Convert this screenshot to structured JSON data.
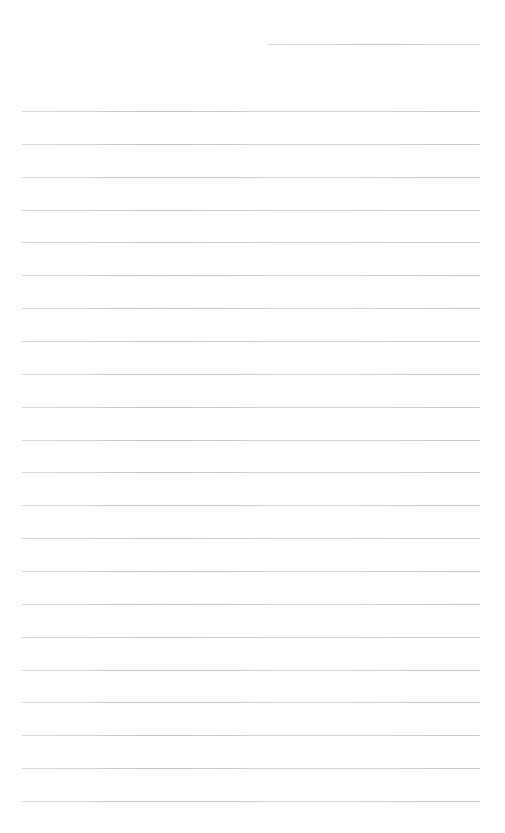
{
  "page": {
    "type": "blank-lined-paper",
    "background_color": "#ffffff",
    "rule_color": "#c4c4c4",
    "header_line": {
      "x_start": 267,
      "x_end": 480,
      "y": 44
    },
    "ruled_lines": {
      "count": 22,
      "x_start": 22,
      "x_end": 480,
      "first_y": 111,
      "last_y": 801
    },
    "text_content": []
  }
}
